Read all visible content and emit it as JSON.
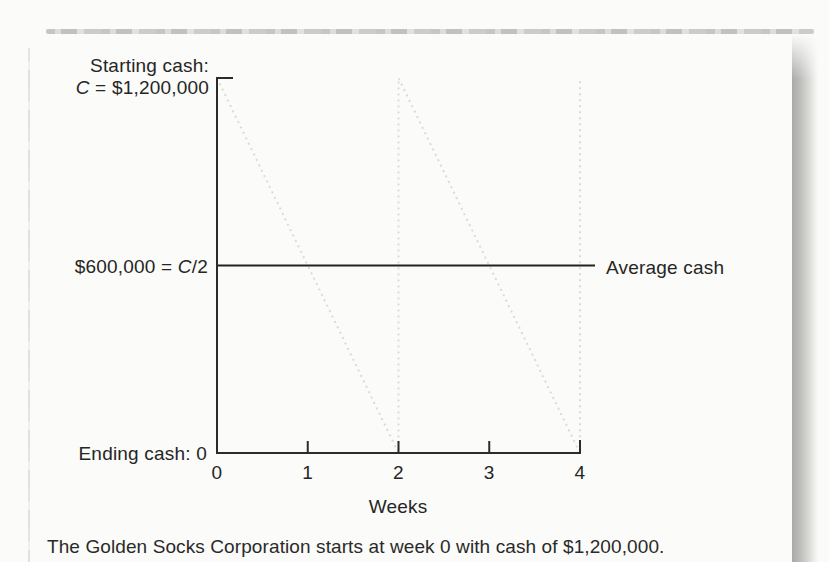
{
  "figure": {
    "labels": {
      "starting_line1": "Starting cash:",
      "starting_c": "C",
      "starting_rest": " = $1,200,000",
      "mid_pre": "$600,000 = ",
      "mid_c": "C",
      "mid_post": "/2",
      "ending": "Ending cash: 0",
      "average": "Average cash",
      "x_title": "Weeks"
    },
    "caption": "The Golden Socks Corporation starts at week 0 with cash of $1,200,000."
  },
  "chart_data": {
    "type": "line",
    "title": "",
    "xlabel": "Weeks",
    "ylabel": "Cash balance ($)",
    "xlim": [
      0,
      4
    ],
    "ylim": [
      0,
      1200000
    ],
    "x_ticks": [
      0,
      1,
      2,
      3,
      4
    ],
    "grid": false,
    "y_markers": [
      {
        "value": 1200000,
        "label": "Starting cash: C = $1,200,000"
      },
      {
        "value": 600000,
        "label": "$600,000 = C/2"
      },
      {
        "value": 0,
        "label": "Ending cash: 0"
      }
    ],
    "series": [
      {
        "name": "Cash balance (sawtooth)",
        "style": "dotted-light",
        "points": [
          [
            0,
            1200000
          ],
          [
            2,
            0
          ],
          [
            2,
            1200000
          ],
          [
            4,
            0
          ],
          [
            4,
            1200000
          ]
        ]
      },
      {
        "name": "Average cash",
        "style": "solid",
        "extends_right": true,
        "points": [
          [
            0,
            600000
          ],
          [
            4,
            600000
          ]
        ]
      }
    ],
    "annotations": [
      {
        "text": "Average cash",
        "at_y": 600000,
        "position": "right-of-plot"
      }
    ]
  }
}
